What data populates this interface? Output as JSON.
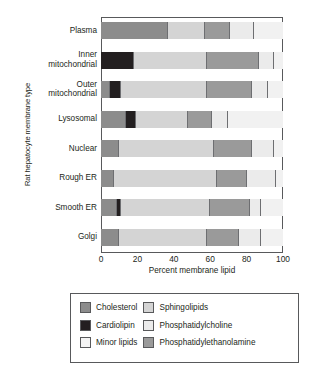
{
  "chart_data": {
    "type": "bar",
    "orientation": "horizontal",
    "stacked": true,
    "title": "",
    "xlabel": "Percent membrane lipid",
    "ylabel": "Rat hepatocyte membrane type",
    "xlim": [
      0,
      100
    ],
    "xticks": [
      0,
      20,
      40,
      60,
      80,
      100
    ],
    "xtick_labels": [
      "0",
      "20",
      "40",
      "60",
      "80",
      "100"
    ],
    "grid": false,
    "legend_position": "below-plot",
    "categories": [
      "Plasma",
      "Inner mitochondrial",
      "Outer mitochondrial",
      "Lysosomal",
      "Nuclear",
      "Rough ER",
      "Smooth ER",
      "Golgi"
    ],
    "series": [
      {
        "name": "Cholesterol",
        "color": "#8c8c8c",
        "values": [
          37,
          0,
          5,
          14,
          10,
          7,
          9,
          10
        ]
      },
      {
        "name": "Cardiolipin",
        "color": "#231f20",
        "values": [
          0,
          18,
          6,
          5,
          0,
          0,
          2,
          0
        ]
      },
      {
        "name": "Minor lipids",
        "color": "#f1f1f1",
        "values": [
          0,
          0,
          0,
          0,
          0,
          0,
          0,
          0
        ]
      },
      {
        "name": "Sphingolipids",
        "color": "#d4d4d4",
        "values": [
          20,
          40,
          47,
          29,
          52,
          57,
          49,
          48
        ]
      },
      {
        "name": "Phosphatidylcholine",
        "color": "#ebebeb",
        "values": [
          13,
          8,
          9,
          9,
          12,
          16,
          6,
          12
        ]
      },
      {
        "name": "Phosphatidylethanolamine",
        "color": "#9a9a9a",
        "values": [
          14,
          29,
          25,
          13,
          21,
          16,
          22,
          18
        ]
      }
    ],
    "bars": [
      {
        "category": "Plasma",
        "label_lines": [
          "Plasma"
        ],
        "segments": [
          {
            "series": "Cholesterol",
            "value": 37
          },
          {
            "series": "Sphingolipids",
            "value": 20
          },
          {
            "series": "Phosphatidylethanolamine",
            "value": 14
          },
          {
            "series": "Phosphatidylcholine",
            "value": 13
          },
          {
            "series": "Minor lipids",
            "value": 16
          }
        ]
      },
      {
        "category": "Inner mitochondrial",
        "label_lines": [
          "Inner",
          "mitochondrial"
        ],
        "segments": [
          {
            "series": "Cardiolipin",
            "value": 18
          },
          {
            "series": "Sphingolipids",
            "value": 40
          },
          {
            "series": "Phosphatidylethanolamine",
            "value": 29
          },
          {
            "series": "Phosphatidylcholine",
            "value": 8
          },
          {
            "series": "Minor lipids",
            "value": 5
          }
        ]
      },
      {
        "category": "Outer mitochondrial",
        "label_lines": [
          "Outer",
          "mitochondrial"
        ],
        "segments": [
          {
            "series": "Cholesterol",
            "value": 5
          },
          {
            "series": "Cardiolipin",
            "value": 6
          },
          {
            "series": "Sphingolipids",
            "value": 47
          },
          {
            "series": "Phosphatidylethanolamine",
            "value": 25
          },
          {
            "series": "Phosphatidylcholine",
            "value": 9
          },
          {
            "series": "Minor lipids",
            "value": 8
          }
        ]
      },
      {
        "category": "Lysosomal",
        "label_lines": [
          "Lysosomal"
        ],
        "segments": [
          {
            "series": "Cholesterol",
            "value": 14
          },
          {
            "series": "Cardiolipin",
            "value": 5
          },
          {
            "series": "Sphingolipids",
            "value": 29
          },
          {
            "series": "Phosphatidylethanolamine",
            "value": 13
          },
          {
            "series": "Phosphatidylcholine",
            "value": 9
          },
          {
            "series": "Minor lipids",
            "value": 30
          }
        ]
      },
      {
        "category": "Nuclear",
        "label_lines": [
          "Nuclear"
        ],
        "segments": [
          {
            "series": "Cholesterol",
            "value": 10
          },
          {
            "series": "Sphingolipids",
            "value": 52
          },
          {
            "series": "Phosphatidylethanolamine",
            "value": 21
          },
          {
            "series": "Phosphatidylcholine",
            "value": 12
          },
          {
            "series": "Minor lipids",
            "value": 5
          }
        ]
      },
      {
        "category": "Rough ER",
        "label_lines": [
          "Rough ER"
        ],
        "segments": [
          {
            "series": "Cholesterol",
            "value": 7
          },
          {
            "series": "Sphingolipids",
            "value": 57
          },
          {
            "series": "Phosphatidylethanolamine",
            "value": 16
          },
          {
            "series": "Phosphatidylcholine",
            "value": 16
          },
          {
            "series": "Minor lipids",
            "value": 4
          }
        ]
      },
      {
        "category": "Smooth ER",
        "label_lines": [
          "Smooth ER"
        ],
        "segments": [
          {
            "series": "Cholesterol",
            "value": 9
          },
          {
            "series": "Cardiolipin",
            "value": 2
          },
          {
            "series": "Sphingolipids",
            "value": 49
          },
          {
            "series": "Phosphatidylethanolamine",
            "value": 22
          },
          {
            "series": "Phosphatidylcholine",
            "value": 6
          },
          {
            "series": "Minor lipids",
            "value": 12
          }
        ]
      },
      {
        "category": "Golgi",
        "label_lines": [
          "Golgi"
        ],
        "segments": [
          {
            "series": "Cholesterol",
            "value": 10
          },
          {
            "series": "Sphingolipids",
            "value": 48
          },
          {
            "series": "Phosphatidylethanolamine",
            "value": 18
          },
          {
            "series": "Phosphatidylcholine",
            "value": 12
          },
          {
            "series": "Minor lipids",
            "value": 12
          }
        ]
      }
    ],
    "legend": {
      "columns": [
        [
          {
            "label": "Cholesterol",
            "color": "#8c8c8c"
          },
          {
            "label": "Cardiolipin",
            "color": "#231f20"
          },
          {
            "label": "Minor lipids",
            "color": "#f4f4f4"
          }
        ],
        [
          {
            "label": "Sphingolipids",
            "color": "#d4d4d4"
          },
          {
            "label": "Phosphatidylcholine",
            "color": "#ebebeb"
          },
          {
            "label": "Phosphatidylethanolamine",
            "color": "#9a9a9a"
          }
        ]
      ]
    }
  }
}
